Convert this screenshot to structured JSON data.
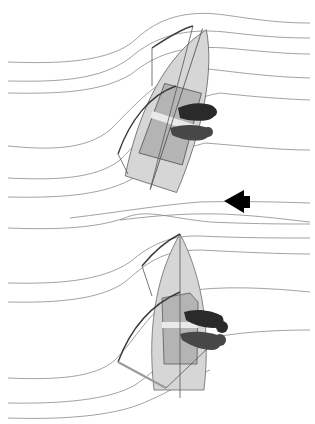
{
  "figure": {
    "type": "sailing-airflow-diagram",
    "panels": [
      {
        "id": "top",
        "description": "Dinghy heeled/angled on a reach with crew hiking to starboard; streamlines bend around the sail",
        "crew_count": 2
      },
      {
        "id": "bottom",
        "description": "Dinghy pointing upwind with sail sheeted, crew seated to starboard; streamlines bend around the sail",
        "crew_count": 2
      }
    ],
    "wind_arrow": {
      "direction": "left",
      "color": "#000000"
    },
    "colors": {
      "streamline": "#8a8a8a",
      "hull": "#d6d6d6",
      "cockpit": "#b4b4b4",
      "sail": "#3a3a3a",
      "crew": "#2a2a2a",
      "background": "#ffffff"
    }
  }
}
